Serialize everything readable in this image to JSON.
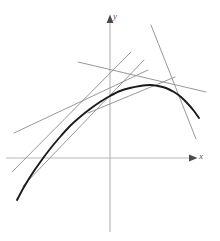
{
  "figure": {
    "name": "tangent-lines-to-concave-curve",
    "width": 220,
    "height": 241,
    "background": "#ffffff"
  },
  "axes": {
    "x_label": "x",
    "y_label": "y",
    "origin": [
      110,
      158
    ],
    "color": "#b9b9b9",
    "stroke_width": 1.2,
    "x_axis": {
      "from": [
        6,
        158
      ],
      "to": [
        196,
        158
      ],
      "arrow": "right"
    },
    "y_axis": {
      "from": [
        110,
        232
      ],
      "to": [
        110,
        15
      ],
      "arrow": "up"
    },
    "arrow_color": "#555555",
    "ticks": [],
    "grid": false
  },
  "curve": {
    "name": "main-curve",
    "color": "#1a1a1a",
    "stroke_width": 1.9,
    "description": "concave-down curve rising steeply from lower left, peaking near x=150, falling to the right",
    "points": [
      [
        17,
        200
      ],
      [
        24,
        187
      ],
      [
        32,
        174
      ],
      [
        41,
        161
      ],
      [
        50,
        149
      ],
      [
        60,
        137
      ],
      [
        70,
        126
      ],
      [
        80,
        117
      ],
      [
        90,
        109
      ],
      [
        100,
        102
      ],
      [
        110,
        96
      ],
      [
        120,
        91
      ],
      [
        130,
        88
      ],
      [
        140,
        86
      ],
      [
        150,
        85
      ],
      [
        158,
        86
      ],
      [
        166,
        88
      ],
      [
        174,
        92
      ],
      [
        181,
        97
      ],
      [
        188,
        104
      ],
      [
        194,
        111
      ],
      [
        199,
        118
      ]
    ]
  },
  "tangent_lines": {
    "color": "#8c8c8c",
    "stroke_width": 0.9,
    "items": [
      {
        "name": "tangent-line-1",
        "from": [
          14,
          133
        ],
        "to": [
          148,
          70
        ],
        "tangent_at": [
          63,
          134
        ]
      },
      {
        "name": "tangent-line-2",
        "from": [
          12,
          172
        ],
        "to": [
          131,
          52
        ],
        "tangent_at": [
          48,
          151
        ]
      },
      {
        "name": "tangent-line-3",
        "from": [
          23,
          186
        ],
        "to": [
          144,
          60
        ],
        "tangent_at": [
          60,
          138
        ]
      },
      {
        "name": "tangent-line-4",
        "from": [
          78,
          62
        ],
        "to": [
          206,
          92
        ],
        "tangent_at": [
          150,
          85
        ]
      },
      {
        "name": "tangent-line-5",
        "from": [
          151,
          25
        ],
        "to": [
          196,
          139
        ],
        "tangent_at": [
          184,
          99
        ]
      },
      {
        "name": "tangent-line-6",
        "from": [
          88,
          113
        ],
        "to": [
          175,
          77
        ],
        "tangent_at": [
          131,
          88
        ]
      }
    ]
  }
}
